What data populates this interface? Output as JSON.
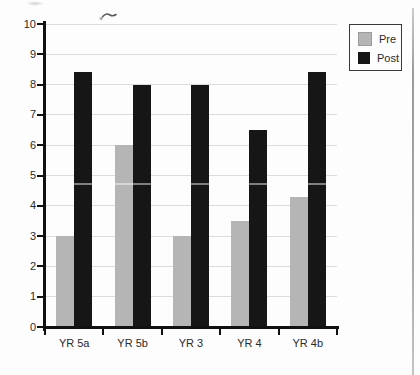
{
  "chart_data": {
    "type": "bar",
    "title": "",
    "xlabel": "",
    "ylabel": "",
    "categories": [
      "YR 5a",
      "YR 5b",
      "YR 3",
      "YR 4",
      "YR 4b"
    ],
    "series": [
      {
        "name": "Pre",
        "color": "#b5b5b5",
        "values": [
          3,
          6,
          3,
          3.5,
          4.3
        ]
      },
      {
        "name": "Post",
        "color": "#161616",
        "values": [
          8.4,
          8,
          8,
          6.5,
          8.4
        ]
      }
    ],
    "ylim": [
      0,
      10
    ],
    "ytick_step": 1,
    "y_tick_labels": [
      "0",
      "1",
      "2",
      "3",
      "4",
      "5",
      "6",
      "7",
      "8",
      "9",
      "10"
    ],
    "grid": true,
    "legend_position": "top-right"
  },
  "legend": {
    "items": [
      {
        "label": "Pre"
      },
      {
        "label": "Post"
      }
    ]
  },
  "colors": {
    "axis": "#111111",
    "gridline": "#dcdcdc",
    "text": "#2b2b2b"
  }
}
